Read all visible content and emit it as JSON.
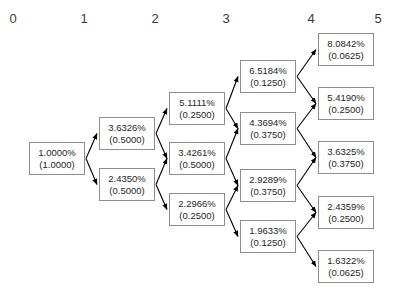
{
  "diagram": {
    "type": "binomial-tree",
    "background_color": "#ffffff",
    "node_border_color": "#8e8e8e",
    "edge_color": "#000000",
    "text_color": "#262626",
    "column_headers": [
      {
        "label": "0",
        "x": 13,
        "y": 12
      },
      {
        "label": "1",
        "x": 84,
        "y": 12
      },
      {
        "label": "2",
        "x": 155,
        "y": 12
      },
      {
        "label": "3",
        "x": 226,
        "y": 12
      },
      {
        "label": "4",
        "x": 311,
        "y": 12
      },
      {
        "label": "5",
        "x": 378,
        "y": 12
      }
    ],
    "columns": [
      {
        "step": 0,
        "nodes": [
          {
            "rate": "1.0000%",
            "prob": "(1.0000)",
            "x": 29,
            "y": 142
          }
        ]
      },
      {
        "step": 1,
        "nodes": [
          {
            "rate": "3.6326%",
            "prob": "(0.5000)",
            "x": 99,
            "y": 117
          },
          {
            "rate": "2.4350%",
            "prob": "(0.5000)",
            "x": 99,
            "y": 168
          }
        ]
      },
      {
        "step": 2,
        "nodes": [
          {
            "rate": "5.1111%",
            "prob": "(0.2500)",
            "x": 169,
            "y": 92
          },
          {
            "rate": "3.4261%",
            "prob": "(0.5000)",
            "x": 169,
            "y": 142
          },
          {
            "rate": "2.2966%",
            "prob": "(0.2500)",
            "x": 169,
            "y": 193
          }
        ]
      },
      {
        "step": 3,
        "nodes": [
          {
            "rate": "6.5184%",
            "prob": "(0.1250)",
            "x": 240,
            "y": 60
          },
          {
            "rate": "4.3694%",
            "prob": "(0.3750)",
            "x": 240,
            "y": 112
          },
          {
            "rate": "2.9289%",
            "prob": "(0.3750)",
            "x": 240,
            "y": 169
          },
          {
            "rate": "1.9633%",
            "prob": "(0.1250)",
            "x": 240,
            "y": 220
          }
        ]
      },
      {
        "step": 4,
        "nodes": [
          {
            "rate": "8.0842%",
            "prob": "(0.0625)",
            "x": 318,
            "y": 33
          },
          {
            "rate": "5.4190%",
            "prob": "(0.2500)",
            "x": 318,
            "y": 87
          },
          {
            "rate": "3.6325%",
            "prob": "(0.3750)",
            "x": 318,
            "y": 141
          },
          {
            "rate": "2.4359%",
            "prob": "(0.2500)",
            "x": 318,
            "y": 196
          },
          {
            "rate": "1.6322%",
            "prob": "(0.0625)",
            "x": 318,
            "y": 250
          }
        ]
      }
    ],
    "edges": [
      {
        "from": "0.0",
        "to": "1.0"
      },
      {
        "from": "0.0",
        "to": "1.1"
      },
      {
        "from": "1.0",
        "to": "2.0"
      },
      {
        "from": "1.0",
        "to": "2.1"
      },
      {
        "from": "1.1",
        "to": "2.1"
      },
      {
        "from": "1.1",
        "to": "2.2"
      },
      {
        "from": "2.0",
        "to": "3.0"
      },
      {
        "from": "2.0",
        "to": "3.1"
      },
      {
        "from": "2.1",
        "to": "3.1"
      },
      {
        "from": "2.1",
        "to": "3.2"
      },
      {
        "from": "2.2",
        "to": "3.2"
      },
      {
        "from": "2.2",
        "to": "3.3"
      },
      {
        "from": "3.0",
        "to": "4.0"
      },
      {
        "from": "3.0",
        "to": "4.1"
      },
      {
        "from": "3.1",
        "to": "4.1"
      },
      {
        "from": "3.1",
        "to": "4.2"
      },
      {
        "from": "3.2",
        "to": "4.2"
      },
      {
        "from": "3.2",
        "to": "4.3"
      },
      {
        "from": "3.3",
        "to": "4.3"
      },
      {
        "from": "3.3",
        "to": "4.4"
      }
    ]
  },
  "chart_data": {
    "type": "diagram",
    "steps": [
      0,
      1,
      2,
      3,
      4,
      5
    ],
    "series": [
      {
        "name": "step 0",
        "rates": [
          1.0
        ],
        "probabilities": [
          1.0
        ]
      },
      {
        "name": "step 1",
        "rates": [
          3.6326,
          2.435
        ],
        "probabilities": [
          0.5,
          0.5
        ]
      },
      {
        "name": "step 2",
        "rates": [
          5.1111,
          3.4261,
          2.2966
        ],
        "probabilities": [
          0.25,
          0.5,
          0.25
        ]
      },
      {
        "name": "step 3",
        "rates": [
          6.5184,
          4.3694,
          2.9289,
          1.9633
        ],
        "probabilities": [
          0.125,
          0.375,
          0.375,
          0.125
        ]
      },
      {
        "name": "step 4",
        "rates": [
          8.0842,
          5.419,
          3.6325,
          2.4359,
          1.6322
        ],
        "probabilities": [
          0.0625,
          0.25,
          0.375,
          0.25,
          0.0625
        ]
      }
    ],
    "xlabel": "",
    "ylabel": "",
    "grid": false,
    "legend": "none"
  }
}
